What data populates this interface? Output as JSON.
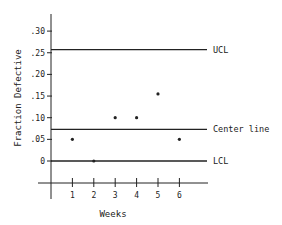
{
  "chart_data": {
    "type": "scatter",
    "title": "",
    "xlabel": "Weeks",
    "ylabel": "Fraction Defective",
    "x": [
      1,
      2,
      3,
      4,
      5,
      6
    ],
    "values": [
      0.05,
      0.0,
      0.1,
      0.1,
      0.155,
      0.05
    ],
    "x_ticks": [
      "1",
      "2",
      "3",
      "4",
      "5",
      "6"
    ],
    "y_ticks": [
      {
        "value": 0.3,
        "label": ".30"
      },
      {
        "value": 0.25,
        "label": ".25"
      },
      {
        "value": 0.2,
        "label": ".20"
      },
      {
        "value": 0.15,
        "label": ".15"
      },
      {
        "value": 0.1,
        "label": ".10"
      },
      {
        "value": 0.05,
        "label": ".05"
      },
      {
        "value": 0.0,
        "label": "0"
      }
    ],
    "ylim": [
      -0.05,
      0.34
    ],
    "xlim": [
      0,
      7.3
    ],
    "grid": false,
    "reference_lines": [
      {
        "name": "UCL",
        "label": "UCL",
        "value": 0.257
      },
      {
        "name": "Center line",
        "label": "Center line",
        "value": 0.073
      },
      {
        "name": "LCL",
        "label": "LCL",
        "value": 0.0
      }
    ],
    "annotations": [
      "UCL",
      "Center line",
      "LCL"
    ]
  },
  "colors": {
    "ink": "#222222",
    "background": "#ffffff"
  }
}
